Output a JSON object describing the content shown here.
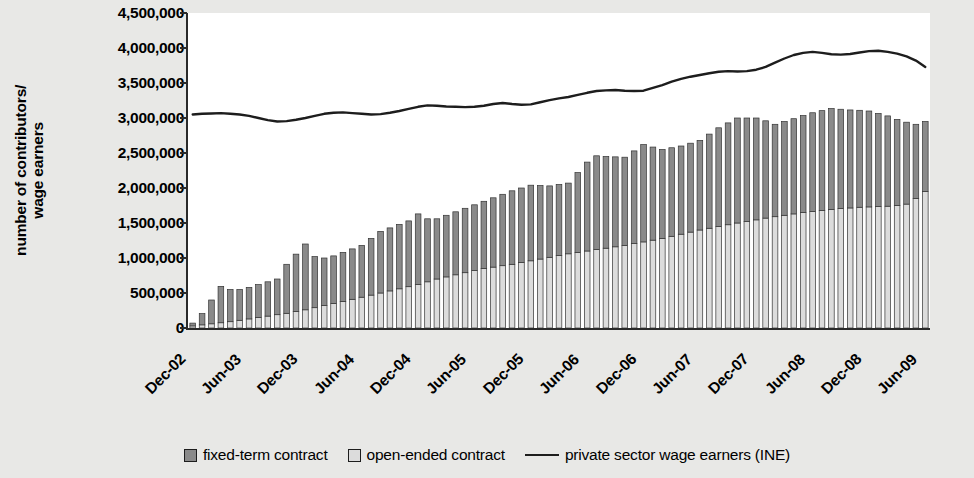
{
  "axes": {
    "ylabel": "number of contributors/ wage earners",
    "ylabel_line1": "number of contributors/",
    "ylabel_line2": "wage earners"
  },
  "legend": {
    "items": [
      {
        "label": "fixed-term contract",
        "type": "swatch",
        "color": "#8a8a8a"
      },
      {
        "label": "open-ended contract",
        "type": "swatch",
        "color": "#dcdcdc"
      },
      {
        "label": "private sector wage earners (INE)",
        "type": "line",
        "color": "#1d1d1d"
      }
    ]
  },
  "colors": {
    "fixed_term": "#8a8a8a",
    "open_ended": "#dcdcdc",
    "line": "#1d1d1d",
    "axis": "#2a2a2a",
    "plot_background": "#ffffff",
    "page_background": "#e8e8e6"
  },
  "chart_data": {
    "type": "bar",
    "subtype": "stacked-bar-with-line-overlay",
    "title": "",
    "xlabel": "",
    "ylabel": "number of contributors/ wage earners",
    "ylim": [
      0,
      4500000
    ],
    "ytick_values": [
      0,
      500000,
      1000000,
      1500000,
      2000000,
      2500000,
      3000000,
      3500000,
      4000000,
      4500000
    ],
    "ytick_labels": [
      "0",
      "500,000",
      "1,000,000",
      "1,500,000",
      "2,000,000",
      "2,500,000",
      "3,000,000",
      "3,500,000",
      "4,000,000",
      "4,500,000"
    ],
    "grid": false,
    "legend_position": "bottom",
    "x_tick_labels": [
      "Dec-02",
      "Jun-03",
      "Dec-03",
      "Jun-04",
      "Dec-04",
      "Jun-05",
      "Dec-05",
      "Jun-06",
      "Dec-06",
      "Jun-07",
      "Dec-07",
      "Jun-08",
      "Dec-08",
      "Jun-09"
    ],
    "x_tick_indices": [
      0,
      6,
      12,
      18,
      24,
      30,
      36,
      42,
      48,
      54,
      60,
      66,
      72,
      78
    ],
    "x": [
      "Dec-02",
      "Jan-03",
      "Feb-03",
      "Mar-03",
      "Apr-03",
      "May-03",
      "Jun-03",
      "Jul-03",
      "Aug-03",
      "Sep-03",
      "Oct-03",
      "Nov-03",
      "Dec-03",
      "Jan-04",
      "Feb-04",
      "Mar-04",
      "Apr-04",
      "May-04",
      "Jun-04",
      "Jul-04",
      "Aug-04",
      "Sep-04",
      "Oct-04",
      "Nov-04",
      "Dec-04",
      "Jan-05",
      "Feb-05",
      "Mar-05",
      "Apr-05",
      "May-05",
      "Jun-05",
      "Jul-05",
      "Aug-05",
      "Sep-05",
      "Oct-05",
      "Nov-05",
      "Dec-05",
      "Jan-06",
      "Feb-06",
      "Mar-06",
      "Apr-06",
      "May-06",
      "Jun-06",
      "Jul-06",
      "Aug-06",
      "Sep-06",
      "Oct-06",
      "Nov-06",
      "Dec-06",
      "Jan-07",
      "Feb-07",
      "Mar-07",
      "Apr-07",
      "May-07",
      "Jun-07",
      "Jul-07",
      "Aug-07",
      "Sep-07",
      "Oct-07",
      "Nov-07",
      "Dec-07",
      "Jan-08",
      "Feb-08",
      "Mar-08",
      "Apr-08",
      "May-08",
      "Jun-08",
      "Jul-08",
      "Aug-08",
      "Sep-08",
      "Oct-08",
      "Nov-08",
      "Dec-08",
      "Jan-09",
      "Feb-09",
      "Mar-09",
      "Apr-09",
      "May-09",
      "Jun-09"
    ],
    "series": [
      {
        "name": "open-ended contract",
        "stack": "bars",
        "color": "#dcdcdc",
        "values": [
          30000,
          45000,
          60000,
          75000,
          90000,
          110000,
          130000,
          150000,
          170000,
          190000,
          210000,
          235000,
          260000,
          290000,
          320000,
          350000,
          380000,
          410000,
          440000,
          470000,
          500000,
          530000,
          560000,
          590000,
          620000,
          660000,
          700000,
          730000,
          760000,
          790000,
          820000,
          850000,
          870000,
          890000,
          910000,
          935000,
          960000,
          985000,
          1010000,
          1035000,
          1060000,
          1080000,
          1100000,
          1120000,
          1140000,
          1160000,
          1180000,
          1205000,
          1230000,
          1255000,
          1280000,
          1310000,
          1340000,
          1370000,
          1400000,
          1425000,
          1450000,
          1475000,
          1500000,
          1520000,
          1545000,
          1570000,
          1590000,
          1610000,
          1630000,
          1650000,
          1665000,
          1680000,
          1695000,
          1705000,
          1715000,
          1725000,
          1730000,
          1735000,
          1740000,
          1750000,
          1770000,
          1850000,
          1950000
        ]
      },
      {
        "name": "fixed-term contract",
        "stack": "bars",
        "color": "#8a8a8a",
        "values": [
          40000,
          160000,
          340000,
          520000,
          460000,
          440000,
          450000,
          470000,
          490000,
          510000,
          700000,
          820000,
          940000,
          730000,
          680000,
          680000,
          700000,
          720000,
          740000,
          810000,
          880000,
          900000,
          920000,
          940000,
          1010000,
          900000,
          860000,
          880000,
          900000,
          920000,
          940000,
          960000,
          990000,
          1020000,
          1050000,
          1065000,
          1080000,
          1050000,
          1020000,
          1015000,
          1010000,
          1140000,
          1270000,
          1340000,
          1310000,
          1285000,
          1260000,
          1325000,
          1390000,
          1330000,
          1270000,
          1265000,
          1260000,
          1270000,
          1280000,
          1345000,
          1410000,
          1455000,
          1500000,
          1480000,
          1455000,
          1390000,
          1320000,
          1340000,
          1360000,
          1385000,
          1410000,
          1425000,
          1440000,
          1420000,
          1400000,
          1385000,
          1370000,
          1330000,
          1290000,
          1230000,
          1170000,
          1060000,
          1000000
        ]
      },
      {
        "name": "private sector wage earners (INE)",
        "type": "line",
        "color": "#1d1d1d",
        "values": [
          3050000,
          3060000,
          3065000,
          3070000,
          3060000,
          3050000,
          3030000,
          3000000,
          2970000,
          2950000,
          2955000,
          2975000,
          3000000,
          3030000,
          3060000,
          3075000,
          3080000,
          3070000,
          3060000,
          3050000,
          3055000,
          3075000,
          3100000,
          3130000,
          3160000,
          3180000,
          3175000,
          3165000,
          3160000,
          3155000,
          3160000,
          3175000,
          3200000,
          3215000,
          3200000,
          3190000,
          3195000,
          3225000,
          3255000,
          3280000,
          3300000,
          3330000,
          3360000,
          3385000,
          3395000,
          3400000,
          3390000,
          3385000,
          3390000,
          3430000,
          3470000,
          3520000,
          3560000,
          3590000,
          3615000,
          3640000,
          3660000,
          3670000,
          3665000,
          3670000,
          3690000,
          3730000,
          3790000,
          3850000,
          3900000,
          3930000,
          3945000,
          3930000,
          3910000,
          3905000,
          3915000,
          3935000,
          3955000,
          3960000,
          3945000,
          3920000,
          3880000,
          3820000,
          3730000
        ]
      }
    ]
  }
}
